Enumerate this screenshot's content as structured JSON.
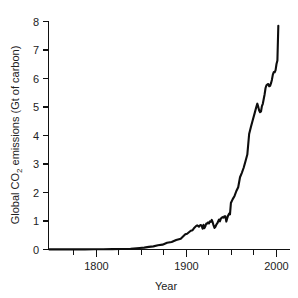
{
  "chart_data": {
    "type": "line",
    "title": "",
    "xlabel": "Year",
    "ylabel": "Global CO2 emissions (Gt of carbon)",
    "ylabel_parts": {
      "pre": "Global CO",
      "sub": "2",
      "post": " emissions (Gt of carbon)"
    },
    "xlim": [
      1750,
      2002
    ],
    "ylim": [
      0,
      8
    ],
    "grid": false,
    "legend": null,
    "xticks_major": [
      1800,
      1900,
      2000
    ],
    "xtick_labels": [
      "1800",
      "1900",
      "2000"
    ],
    "xticks_minor": [
      1775,
      1825,
      1850,
      1875,
      1925,
      1950,
      1975
    ],
    "yticks": [
      0,
      1,
      2,
      3,
      4,
      5,
      6,
      7,
      8
    ],
    "ytick_labels": [
      "0",
      "1",
      "2",
      "3",
      "4",
      "5",
      "6",
      "7",
      "8"
    ],
    "series": [
      {
        "name": "Global CO2 emissions from fossil fuels and cement",
        "units": "Gt of carbon",
        "x": [
          1751,
          1760,
          1770,
          1780,
          1790,
          1800,
          1810,
          1820,
          1830,
          1840,
          1850,
          1855,
          1860,
          1865,
          1870,
          1875,
          1880,
          1885,
          1890,
          1895,
          1900,
          1902,
          1904,
          1906,
          1908,
          1910,
          1912,
          1913,
          1914,
          1915,
          1916,
          1917,
          1918,
          1919,
          1920,
          1921,
          1922,
          1923,
          1924,
          1925,
          1926,
          1927,
          1928,
          1929,
          1930,
          1931,
          1932,
          1933,
          1934,
          1935,
          1936,
          1937,
          1938,
          1939,
          1940,
          1941,
          1942,
          1943,
          1944,
          1945,
          1946,
          1947,
          1948,
          1949,
          1950,
          1952,
          1954,
          1956,
          1958,
          1960,
          1962,
          1964,
          1966,
          1968,
          1970,
          1972,
          1974,
          1976,
          1978,
          1979,
          1980,
          1981,
          1982,
          1983,
          1984,
          1985,
          1986,
          1987,
          1988,
          1989,
          1990,
          1991,
          1992,
          1993,
          1994,
          1995,
          1996,
          1997,
          1998,
          1999,
          2000,
          2001,
          2002
        ],
        "y": [
          0.003,
          0.003,
          0.004,
          0.005,
          0.006,
          0.008,
          0.01,
          0.013,
          0.018,
          0.025,
          0.054,
          0.065,
          0.091,
          0.11,
          0.147,
          0.17,
          0.236,
          0.266,
          0.336,
          0.381,
          0.534,
          0.554,
          0.606,
          0.658,
          0.678,
          0.764,
          0.829,
          0.846,
          0.829,
          0.8,
          0.846,
          0.86,
          0.825,
          0.73,
          0.87,
          0.75,
          0.816,
          0.912,
          0.906,
          0.948,
          0.915,
          0.985,
          0.972,
          1.038,
          0.959,
          0.845,
          0.757,
          0.798,
          0.869,
          0.913,
          0.981,
          1.052,
          0.99,
          1.086,
          1.116,
          1.137,
          1.12,
          1.169,
          1.164,
          0.98,
          1.096,
          1.196,
          1.256,
          1.23,
          1.63,
          1.767,
          1.879,
          2.053,
          2.186,
          2.535,
          2.69,
          2.868,
          3.097,
          3.33,
          4.053,
          4.306,
          4.542,
          4.776,
          5.017,
          5.116,
          5.004,
          4.876,
          4.819,
          4.842,
          5.031,
          5.113,
          5.279,
          5.449,
          5.666,
          5.763,
          5.793,
          5.808,
          5.727,
          5.744,
          5.835,
          5.959,
          6.136,
          6.222,
          6.22,
          6.296,
          6.51,
          6.63,
          7.85
        ]
      }
    ],
    "annotations": []
  },
  "axes": {
    "x_axis_label": "Year",
    "y_axis_label": "Global CO2 emissions (Gt of carbon)"
  },
  "colors": {
    "curve": "#0d0d0d",
    "axis": "#111111",
    "text": "#222222",
    "background": "#ffffff"
  }
}
